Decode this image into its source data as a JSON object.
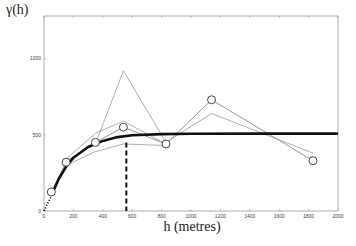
{
  "chart_data": {
    "type": "line",
    "title": "",
    "xlabel": "h (metres)",
    "ylabel": "γ(h)",
    "xlim": [
      0,
      2000
    ],
    "ylim": [
      0,
      1280
    ],
    "grid": false,
    "x_ticks": [
      0,
      200,
      400,
      600,
      800,
      1000,
      1200,
      1400,
      1600,
      1800,
      2000
    ],
    "y_ticks": [
      0,
      500,
      1000
    ],
    "series": [
      {
        "name": "experimental variogram",
        "style": "circles + thin gray line",
        "x": [
          50,
          150,
          350,
          540,
          830,
          1140,
          1830
        ],
        "y": [
          125,
          320,
          450,
          550,
          440,
          730,
          330
        ]
      },
      {
        "name": "replicate 1",
        "style": "thin gray line",
        "x": [
          150,
          350,
          540,
          830,
          1140,
          1830
        ],
        "y": [
          330,
          440,
          920,
          450,
          640,
          380
        ]
      },
      {
        "name": "replicate 2",
        "style": "thin gray line",
        "x": [
          150,
          350,
          540,
          830
        ],
        "y": [
          340,
          510,
          590,
          440
        ]
      },
      {
        "name": "replicate 3",
        "style": "thin gray line",
        "x": [
          150,
          350,
          540,
          830
        ],
        "y": [
          300,
          390,
          440,
          430
        ]
      },
      {
        "name": "fitted model",
        "style": "thick black curve",
        "x": [
          50,
          100,
          150,
          200,
          300,
          400,
          500,
          600,
          800,
          1000,
          1500,
          2000
        ],
        "y": [
          100,
          210,
          290,
          350,
          420,
          460,
          485,
          497,
          505,
          507,
          508,
          508
        ]
      },
      {
        "name": "extrapolation to origin",
        "style": "dotted black",
        "x": [
          0,
          50
        ],
        "y": [
          0,
          100
        ]
      }
    ],
    "annotations": [
      {
        "type": "vertical dashed line",
        "x": 560,
        "y_from": 0,
        "y_to": 450,
        "meaning": "range"
      }
    ]
  },
  "labels": {
    "ylabel": "γ(h)",
    "xlabel": "h (metres)"
  }
}
